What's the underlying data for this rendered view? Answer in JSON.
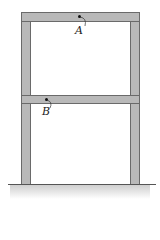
{
  "diagram": {
    "type": "two-story frame",
    "points": [
      {
        "id": "A",
        "label": "A",
        "location": "top beam"
      },
      {
        "id": "B",
        "label": "B",
        "location": "middle beam"
      }
    ],
    "colors": {
      "member": "#b9b9b9",
      "outline": "#6a6a6a",
      "ground": "#cfcfcf"
    }
  }
}
